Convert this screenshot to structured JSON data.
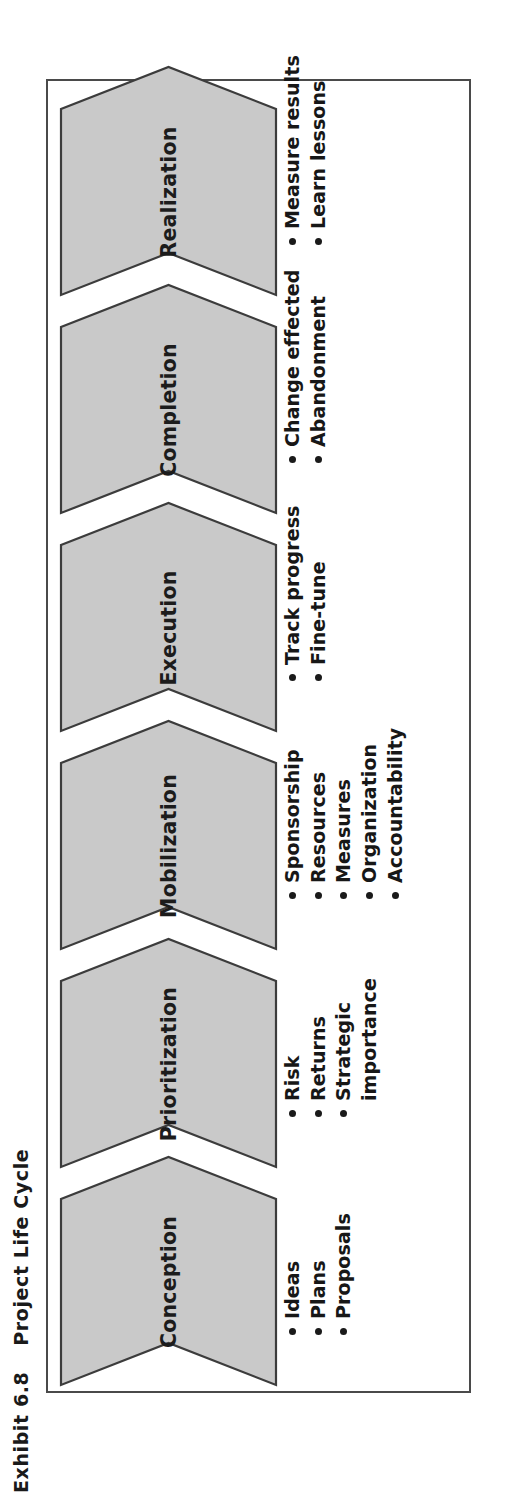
{
  "title": {
    "exhibit_number": "Exhibit 6.8",
    "name": "Project Life Cycle"
  },
  "colors": {
    "chevron_fill": "#c9c9c9",
    "chevron_stroke": "#3c3c3c",
    "panel_border": "#4a4a4a",
    "text": "#1a1a1a"
  },
  "chart_data": {
    "type": "diagram",
    "subtype": "chevron-process-flow",
    "orientation": "rotated-90-ccw",
    "stage_count": 6,
    "stages": [
      {
        "label": "Conception",
        "bullets": [
          "Ideas",
          "Plans",
          "Proposals"
        ]
      },
      {
        "label": "Prioritization",
        "bullets": [
          "Risk",
          "Returns",
          "Strategic importance"
        ]
      },
      {
        "label": "Mobilization",
        "bullets": [
          "Sponsorship",
          "Resources",
          "Measures",
          "Organization",
          "Accountability"
        ]
      },
      {
        "label": "Execution",
        "bullets": [
          "Track progress",
          "Fine-tune"
        ]
      },
      {
        "label": "Completion",
        "bullets": [
          "Change effected",
          "Abandonment"
        ]
      },
      {
        "label": "Realization",
        "bullets": [
          "Measure results",
          "Learn lessons"
        ]
      }
    ]
  },
  "stages": [
    {
      "label": "Conception",
      "bullets": [
        {
          "text": "Ideas",
          "dot": true
        },
        {
          "text": "Plans",
          "dot": true
        },
        {
          "text": "Proposals",
          "dot": true
        }
      ]
    },
    {
      "label": "Prioritization",
      "bullets": [
        {
          "text": "Risk",
          "dot": true
        },
        {
          "text": "Returns",
          "dot": true
        },
        {
          "text": "Strategic",
          "dot": true
        },
        {
          "text": "importance",
          "dot": false
        }
      ]
    },
    {
      "label": "Mobilization",
      "bullets": [
        {
          "text": "Sponsorship",
          "dot": true
        },
        {
          "text": "Resources",
          "dot": true
        },
        {
          "text": "Measures",
          "dot": true
        },
        {
          "text": "Organization",
          "dot": true
        },
        {
          "text": "Accountability",
          "dot": true
        }
      ]
    },
    {
      "label": "Execution",
      "bullets": [
        {
          "text": "Track progress",
          "dot": true
        },
        {
          "text": "Fine-tune",
          "dot": true
        }
      ]
    },
    {
      "label": "Completion",
      "bullets": [
        {
          "text": "Change effected",
          "dot": true
        },
        {
          "text": "Abandonment",
          "dot": true
        }
      ]
    },
    {
      "label": "Realization",
      "bullets": [
        {
          "text": "Measure results",
          "dot": true
        },
        {
          "text": "Learn lessons",
          "dot": true
        }
      ]
    }
  ]
}
